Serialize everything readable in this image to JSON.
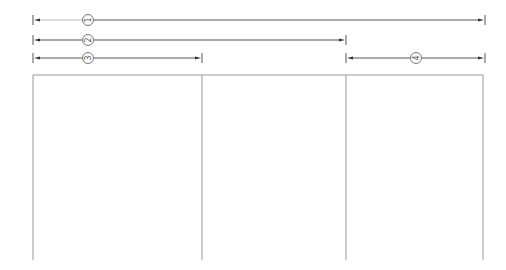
{
  "diagram": {
    "type": "dimension-drawing",
    "dimensions": [
      {
        "id": "dim-1",
        "label": "1",
        "x1": 33,
        "x2": 485,
        "y": 20,
        "bubble_x": 88
      },
      {
        "id": "dim-2",
        "label": "2",
        "x1": 33,
        "x2": 346,
        "y": 40,
        "bubble_x": 88
      },
      {
        "id": "dim-3",
        "label": "3",
        "x1": 33,
        "x2": 202,
        "y": 58,
        "bubble_x": 88
      },
      {
        "id": "dim-4",
        "label": "4",
        "x1": 346,
        "x2": 485,
        "y": 58,
        "bubble_x": 416
      }
    ],
    "frame": {
      "x1": 33,
      "y1": 75,
      "x2": 483,
      "y2": 260
    },
    "dividers": [
      202,
      346
    ],
    "colors": {
      "line": "#555555",
      "frame": "#999999",
      "background": "#ffffff"
    }
  }
}
